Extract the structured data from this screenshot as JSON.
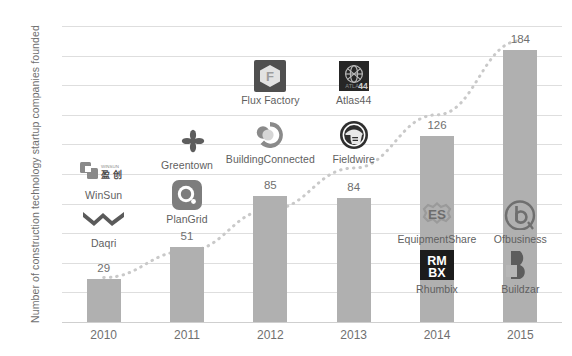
{
  "chart_data": {
    "type": "bar",
    "title": "",
    "xlabel": "",
    "ylabel": "Number of construction technology startup companies founded",
    "categories": [
      "2010",
      "2011",
      "2012",
      "2013",
      "2014",
      "2015"
    ],
    "values": [
      29,
      51,
      85,
      84,
      126,
      184
    ],
    "ylim": [
      0,
      200
    ],
    "y_ticks": [
      0,
      20,
      40,
      60,
      80,
      100,
      120,
      140,
      160,
      180,
      200
    ],
    "grid": true,
    "legend": "none",
    "bar_color": "#b0b0b0",
    "grid_color": "#dedede",
    "text_color": "#6f6f6f",
    "trend": {
      "type": "dotted-exponential",
      "color": "#c9c9c9",
      "points": [
        {
          "x": "2010",
          "y": 30
        },
        {
          "x": "2011",
          "y": 48
        },
        {
          "x": "2012",
          "y": 76
        },
        {
          "x": "2013",
          "y": 104
        },
        {
          "x": "2014",
          "y": 140
        },
        {
          "x": "2015",
          "y": 190
        }
      ]
    },
    "annotations": [
      {
        "group": "2010",
        "name": "WinSun",
        "icon": "winsun-logo"
      },
      {
        "group": "2010",
        "name": "Daqri",
        "icon": "daqri-logo"
      },
      {
        "group": "2011",
        "name": "Greentown",
        "icon": "greentown-logo"
      },
      {
        "group": "2011",
        "name": "PlanGrid",
        "icon": "plangrid-logo"
      },
      {
        "group": "2012",
        "name": "Flux Factory",
        "icon": "flux-factory-logo"
      },
      {
        "group": "2012",
        "name": "BuildingConnected",
        "icon": "buildingconnected-logo"
      },
      {
        "group": "2013",
        "name": "Atlas44",
        "icon": "atlas44-logo"
      },
      {
        "group": "2013",
        "name": "Fieldwire",
        "icon": "fieldwire-logo"
      },
      {
        "group": "2014",
        "name": "EquipmentShare",
        "icon": "equipmentshare-logo"
      },
      {
        "group": "2014",
        "name": "Rhumbix",
        "icon": "rhumbix-logo"
      },
      {
        "group": "2015",
        "name": "Ofbusiness",
        "icon": "ofbusiness-logo"
      },
      {
        "group": "2015",
        "name": "Buildzar",
        "icon": "buildzar-logo"
      }
    ]
  }
}
